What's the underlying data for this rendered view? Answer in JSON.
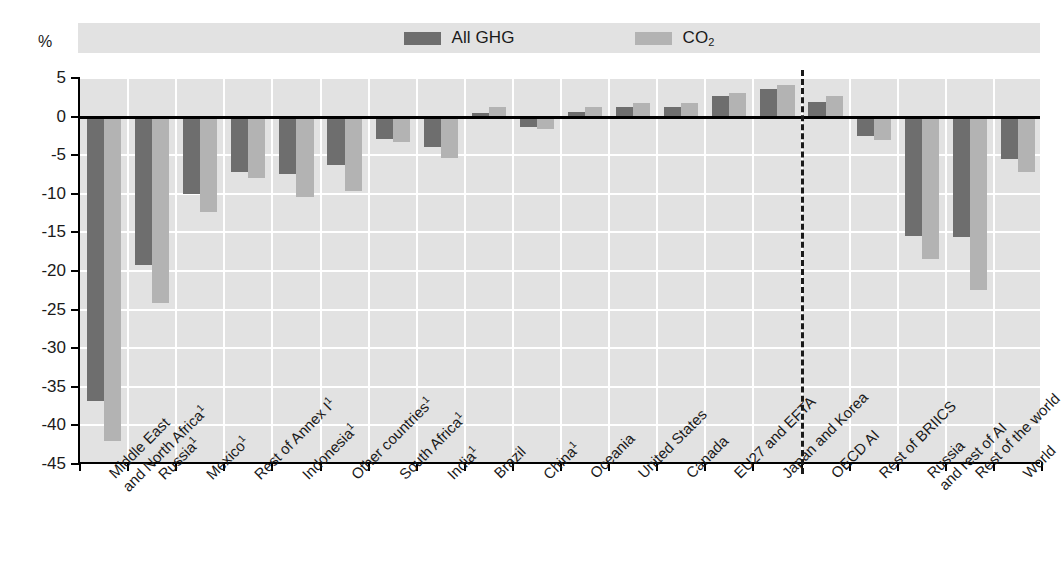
{
  "axis": {
    "unit_label": "%",
    "y_ticks": [
      "5",
      "0",
      "-5",
      "-10",
      "-15",
      "-20",
      "-25",
      "-30",
      "-35",
      "-40",
      "-45"
    ]
  },
  "legend": {
    "entries": [
      {
        "label": "All GHG",
        "color": "#6e6e6e",
        "icon": "legend-swatch-all-ghg"
      },
      {
        "label": "CO",
        "sub": "2",
        "color": "#b3b3b3",
        "icon": "legend-swatch-co2"
      }
    ]
  },
  "chart_data": {
    "type": "bar",
    "title": "",
    "xlabel": "",
    "ylabel": "%",
    "ylim": [
      -45,
      5
    ],
    "yticks": [
      5,
      0,
      -5,
      -10,
      -15,
      -20,
      -25,
      -30,
      -35,
      -40,
      -45
    ],
    "grid": true,
    "legend_position": "top-center",
    "categories": [
      "Middle East and North Africa¹",
      "Russia¹",
      "Mexico¹",
      "Rest of Annex I¹",
      "Indonesia¹",
      "Other countries¹",
      "South Africa¹",
      "India¹",
      "Brazil",
      "China¹",
      "Oceania",
      "United States",
      "Canada",
      "EU27 and EFTA",
      "Japan and Korea",
      "OECD AI",
      "Rest of BRIICS",
      "Russia and rest of AI",
      "Rest of the world",
      "World"
    ],
    "series": [
      {
        "name": "All GHG",
        "color": "#6e6e6e",
        "values": [
          -36.8,
          -19.2,
          -10.0,
          -7.2,
          -7.5,
          -6.3,
          -2.9,
          -3.9,
          0.5,
          -1.3,
          0.6,
          1.2,
          1.3,
          2.7,
          3.6,
          1.9,
          -2.5,
          -15.5,
          -15.6,
          -5.5
        ]
      },
      {
        "name": "CO2",
        "color": "#b3b3b3",
        "values": [
          -42.0,
          -24.2,
          -12.3,
          -8.0,
          -10.4,
          -9.7,
          -3.3,
          -5.4,
          1.3,
          -1.6,
          1.3,
          1.8,
          1.8,
          3.1,
          4.1,
          2.7,
          -3.0,
          -18.5,
          -22.4,
          -7.2
        ]
      }
    ],
    "divider_after_category_index": 14,
    "divider_style": "dashed"
  },
  "xlabels": [
    {
      "line1": "Middle East",
      "line2": "and North Africa",
      "footnote": "1"
    },
    {
      "line1": "Russia",
      "line2": "",
      "footnote": "1"
    },
    {
      "line1": "Mexico",
      "line2": "",
      "footnote": "1"
    },
    {
      "line1": "Rest of Annex I",
      "line2": "",
      "footnote": "1"
    },
    {
      "line1": "Indonesia",
      "line2": "",
      "footnote": "1"
    },
    {
      "line1": "Other countries",
      "line2": "",
      "footnote": "1"
    },
    {
      "line1": "South Africa",
      "line2": "",
      "footnote": "1"
    },
    {
      "line1": "India",
      "line2": "",
      "footnote": "1"
    },
    {
      "line1": "Brazil",
      "line2": "",
      "footnote": ""
    },
    {
      "line1": "China",
      "line2": "",
      "footnote": "1"
    },
    {
      "line1": "Oceania",
      "line2": "",
      "footnote": ""
    },
    {
      "line1": "United States",
      "line2": "",
      "footnote": ""
    },
    {
      "line1": "Canada",
      "line2": "",
      "footnote": ""
    },
    {
      "line1": "EU27 and EFTA",
      "line2": "",
      "footnote": ""
    },
    {
      "line1": "Japan and Korea",
      "line2": "",
      "footnote": ""
    },
    {
      "line1": "OECD AI",
      "line2": "",
      "footnote": ""
    },
    {
      "line1": "Rest of BRIICS",
      "line2": "",
      "footnote": ""
    },
    {
      "line1": "Russia",
      "line2": "and rest of AI",
      "footnote": ""
    },
    {
      "line1": "Rest of the world",
      "line2": "",
      "footnote": ""
    },
    {
      "line1": "World",
      "line2": "",
      "footnote": ""
    }
  ],
  "colors": {
    "all_ghg": "#6e6e6e",
    "co2": "#b3b3b3",
    "plot_background": "#e2e2e2",
    "gridline": "#ffffff",
    "axis": "#000000"
  }
}
